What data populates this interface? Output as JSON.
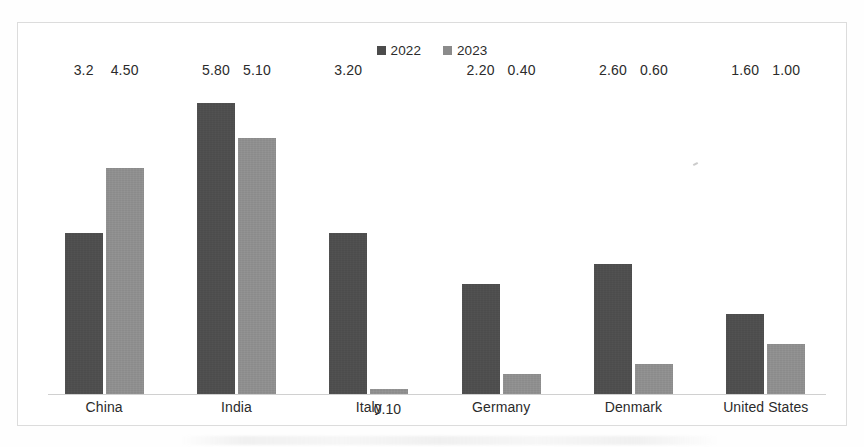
{
  "chart_data": {
    "type": "bar",
    "title": "",
    "subtitle": "",
    "xlabel": "",
    "ylabel": "",
    "grid": false,
    "legend_position": "top-center",
    "axis_baseline_only": true,
    "ylim": [
      0,
      6.2
    ],
    "categories": [
      "China",
      "India",
      "Italy",
      "Germany",
      "Denmark",
      "United States"
    ],
    "series": [
      {
        "name": "2022",
        "color": "#4c4c4c",
        "values": [
          3.2,
          5.8,
          3.2,
          2.2,
          2.6,
          1.6
        ],
        "labels": [
          "3.2",
          "5.80",
          "3.20",
          "2.20",
          "2.60",
          "1.60"
        ]
      },
      {
        "name": "2023",
        "color": "#8b8b8b",
        "values": [
          4.5,
          5.1,
          0.1,
          0.4,
          0.6,
          1.0
        ],
        "labels": [
          "4.50",
          "5.10",
          "0.10",
          "0.40",
          "0.60",
          "1.00"
        ]
      }
    ],
    "annotations": [
      "The 2023 data label 0.10 for Italy overlaps the Italy category label."
    ]
  },
  "legend": {
    "items": [
      {
        "label": "2022",
        "color": "#4c4c4c"
      },
      {
        "label": "2023",
        "color": "#8b8b8b"
      }
    ]
  },
  "colors": {
    "series_2022": "#4c4c4c",
    "series_2023": "#8b8b8b",
    "baseline": "#d0d0d0",
    "frame_border": "#dcdcdc",
    "text": "#2b2b2b",
    "background": "#ffffff"
  }
}
